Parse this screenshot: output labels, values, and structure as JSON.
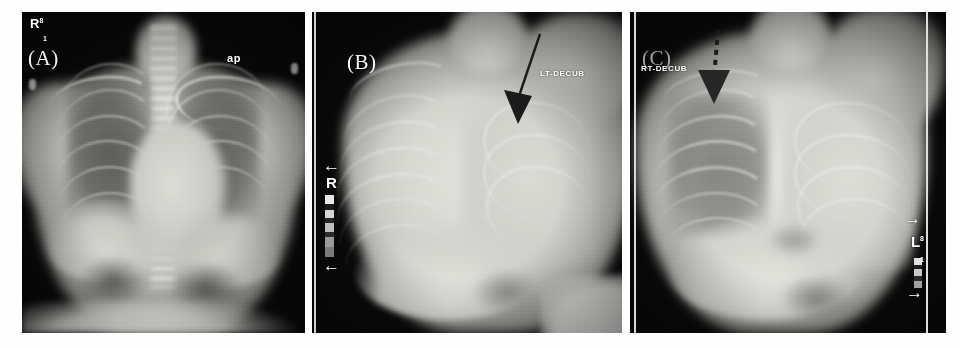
{
  "figure": {
    "kind": "radiograph-panel-figure",
    "background_color": "#ffffff",
    "panel_count": 3,
    "modality_label": "chest radiograph"
  },
  "panels": [
    {
      "id": "A",
      "label": "(A)",
      "view_text": "ap",
      "side_marker_letter": "R",
      "side_marker_sup": "8",
      "side_marker_sub": "1",
      "description": "AP chest radiograph",
      "arrow": null,
      "arrows": []
    },
    {
      "id": "B",
      "label": "(B)",
      "view_text": "LT-DECUB",
      "side_marker_letter": "R",
      "side_marker_sup": "",
      "side_marker_sub": "",
      "description": "Left lateral decubitus chest radiograph",
      "arrow": {
        "style": "solid",
        "color": "#1b1b1b",
        "direction": "down"
      },
      "arrows": [
        "←",
        "←"
      ]
    },
    {
      "id": "C",
      "label": "(C)",
      "view_text": "RT-DECUB",
      "side_marker_letter": "L",
      "side_marker_sup": "8",
      "side_marker_sub": "1",
      "description": "Right lateral decubitus chest radiograph",
      "arrow": {
        "style": "dashed",
        "color": "#1b1b1b",
        "direction": "down"
      },
      "arrows": [
        "→",
        "→"
      ]
    }
  ],
  "colors": {
    "film_black": "#0a0a0a",
    "bone_white": "#f0f0ec",
    "soft_tissue": "#b9b9b4",
    "lung_field": "#6e6e6a",
    "marker_white": "#ffffff",
    "arrow_black": "#1b1b1b",
    "page_background": "#ffffff"
  }
}
